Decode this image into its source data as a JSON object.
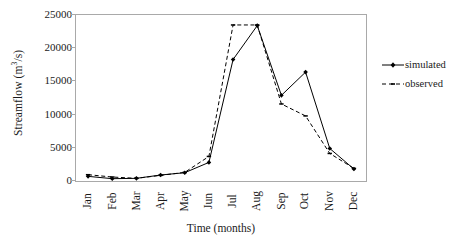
{
  "chart_data": {
    "type": "line",
    "title": "",
    "xlabel": "Time (months)",
    "ylabel": "Streamflow (m3/s)",
    "ylabel_parts": {
      "prefix": "Streamflow (m",
      "sup": "3",
      "suffix": "/s)"
    },
    "categories": [
      "Jan",
      "Feb",
      "Mar",
      "Apr",
      "May",
      "Jun",
      "Jul",
      "Aug",
      "Sep",
      "Oct",
      "Nov",
      "Dec"
    ],
    "series": [
      {
        "name": "simulated",
        "style": "solid",
        "marker": "diamond",
        "color": "#000000",
        "values": [
          700,
          350,
          400,
          900,
          1250,
          2800,
          18300,
          23400,
          12900,
          16400,
          4900,
          1800
        ]
      },
      {
        "name": "observed",
        "style": "dashed",
        "marker": "dash",
        "color": "#000000",
        "values": [
          950,
          600,
          400,
          850,
          1300,
          3700,
          23500,
          23500,
          11600,
          9800,
          4150,
          1900
        ]
      }
    ],
    "ylim": [
      0,
      25000
    ],
    "yticks": [
      0,
      5000,
      10000,
      15000,
      20000,
      25000
    ],
    "ytick_labels": [
      "0",
      "5000",
      "10000",
      "15000",
      "20000",
      "25000"
    ],
    "grid": false,
    "legend_position": "right"
  },
  "legend": {
    "entries": [
      {
        "label": "simulated"
      },
      {
        "label": "observed"
      }
    ]
  },
  "colors": {
    "axis": "#a9a9a9",
    "line": "#000000",
    "text": "#1a1a1a",
    "background": "#ffffff"
  }
}
